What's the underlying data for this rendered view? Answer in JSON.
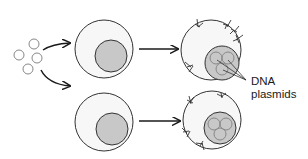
{
  "diagram": {
    "title": "",
    "colors": {
      "outline": "#333333",
      "cell_fill": "#f7f7f7",
      "nucleus_fill": "#c8c8c8",
      "plasmid_stroke": "#888888",
      "arrow": "#1a1a1a",
      "text": "#1a1a1a"
    },
    "label": {
      "line1": "DNA",
      "line2": "plasmids"
    },
    "free_plasmids": [
      {
        "cx": 34,
        "cy": 44,
        "r": 5
      },
      {
        "cx": 19,
        "cy": 55,
        "r": 5
      },
      {
        "cx": 37,
        "cy": 58,
        "r": 5
      },
      {
        "cx": 28,
        "cy": 69,
        "r": 5
      }
    ],
    "cells": [
      {
        "id": "untreated-top",
        "cx": 104,
        "cy": 49,
        "r": 29,
        "nucleus": {
          "cx": 111,
          "cy": 56,
          "r": 16
        }
      },
      {
        "id": "untreated-bottom",
        "cx": 104,
        "cy": 122,
        "r": 29,
        "nucleus": {
          "cx": 112,
          "cy": 129,
          "r": 16
        }
      },
      {
        "id": "transfected-top",
        "cx": 211,
        "cy": 50,
        "r": 30,
        "nucleus": {
          "cx": 222,
          "cy": 63,
          "r": 17
        }
      },
      {
        "id": "transfected-bottom",
        "cx": 212,
        "cy": 120,
        "r": 29,
        "nucleus": {
          "cx": 220,
          "cy": 128,
          "r": 16
        }
      }
    ],
    "arrows": [
      {
        "from": "plasmids",
        "to": "untreated-top"
      },
      {
        "from": "plasmids",
        "to": "untreated-bottom"
      },
      {
        "from": "untreated-top",
        "to": "transfected-top"
      },
      {
        "from": "untreated-bottom",
        "to": "transfected-bottom"
      }
    ]
  }
}
